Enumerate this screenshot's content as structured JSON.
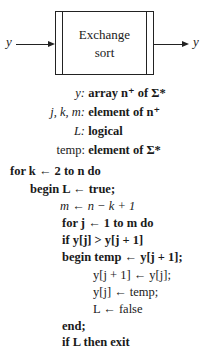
{
  "diagram": {
    "box_label_line1": "Exchange",
    "box_label_line2": "sort",
    "input_label": "y",
    "output_label": "y"
  },
  "declarations": [
    {
      "lhs": "y:",
      "rhs": "array n⁺ of Σ*"
    },
    {
      "lhs": "j, k, m:",
      "rhs": "element of n⁺"
    },
    {
      "lhs": "L:",
      "rhs": "logical"
    },
    {
      "lhs": "temp:",
      "rhs": "element of Σ*"
    }
  ],
  "code": [
    "for k ← 2 to n do",
    "begin L ← true;",
    "m ← n − k + 1",
    "for j ← 1 to m do",
    "if y[j] > y[j + 1]",
    "begin temp ← y[j + 1];",
    "y[j + 1] ← y[j];",
    "y[j] ← temp;",
    "L ← false",
    "end;",
    "if L then exit"
  ]
}
